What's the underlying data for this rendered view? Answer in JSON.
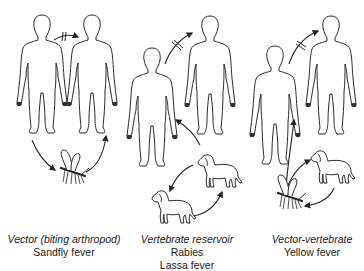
{
  "diagram": {
    "title_fragment": "",
    "panels": [
      {
        "id": "vector",
        "title": "Vector (biting arthropod)",
        "diseases": [
          "Sandfly fever"
        ],
        "nodes": [
          "human",
          "human",
          "arthropod"
        ],
        "edges": [
          {
            "from": "human-1",
            "to": "human-2",
            "blocked": true
          },
          {
            "from": "human-1",
            "to": "arthropod",
            "blocked": false
          },
          {
            "from": "arthropod",
            "to": "human-2",
            "blocked": false
          }
        ]
      },
      {
        "id": "vertebrate-reservoir",
        "title": "Vertebrate reservoir",
        "diseases": [
          "Rabies",
          "Lassa fever"
        ],
        "nodes": [
          "human",
          "human",
          "dog",
          "dog"
        ],
        "edges": [
          {
            "from": "human-1",
            "to": "human-2",
            "blocked": true
          },
          {
            "from": "dog-1",
            "to": "human-1",
            "blocked": false
          },
          {
            "from": "dog-1",
            "to": "dog-2",
            "blocked": false
          },
          {
            "from": "dog-2",
            "to": "dog-1",
            "blocked": false
          }
        ]
      },
      {
        "id": "vector-vertebrate",
        "title": "Vector-vertebrate",
        "diseases": [
          "Yellow fever"
        ],
        "nodes": [
          "human",
          "human",
          "arthropod",
          "dog"
        ],
        "edges": [
          {
            "from": "human-1",
            "to": "human-2",
            "blocked": true
          },
          {
            "from": "arthropod",
            "to": "human-1",
            "blocked": false
          },
          {
            "from": "arthropod",
            "to": "dog",
            "blocked": false
          },
          {
            "from": "dog",
            "to": "arthropod",
            "blocked": false
          }
        ]
      }
    ],
    "icons": {
      "human": "human-figure-icon",
      "dog": "dog-icon",
      "arthropod": "mosquito-icon",
      "blocked_arrow": "blocked-transmission-arrow",
      "arrow": "transmission-arrow"
    },
    "colors": {
      "line": "#222222",
      "background": "#ffffff"
    }
  }
}
